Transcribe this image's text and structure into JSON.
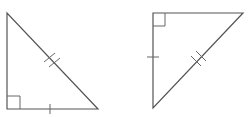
{
  "diagram": {
    "stroke_color": "#555555",
    "background": "#ffffff",
    "triangles": [
      {
        "id": "triangle-left",
        "vertices": [
          [
            7,
            13
          ],
          [
            7,
            109
          ],
          [
            98,
            109
          ]
        ],
        "right_angle_at": [
          7,
          109
        ],
        "single_tick_side": "bottom leg",
        "double_tick_side": "hypotenuse"
      },
      {
        "id": "triangle-right",
        "vertices": [
          [
            153,
            13
          ],
          [
            243,
            13
          ],
          [
            153,
            108
          ]
        ],
        "right_angle_at": [
          153,
          13
        ],
        "single_tick_side": "left leg",
        "double_tick_side": "hypotenuse"
      }
    ]
  }
}
